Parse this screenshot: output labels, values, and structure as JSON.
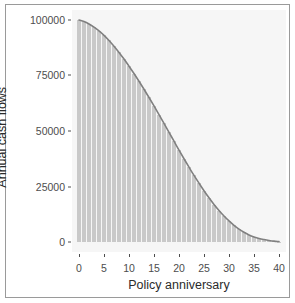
{
  "chart_data": {
    "type": "bar",
    "title": "",
    "subtitle": "",
    "xlabel": "Policy anniversary",
    "ylabel": "Annual cash flows",
    "xlim": [
      0,
      40
    ],
    "ylim": [
      0,
      100000
    ],
    "grid": false,
    "legend": null,
    "x_ticks": [
      0,
      5,
      10,
      15,
      20,
      25,
      30,
      35,
      40
    ],
    "x_tick_labels": [
      "0",
      "5",
      "10",
      "15",
      "20",
      "25",
      "30",
      "35",
      "40"
    ],
    "y_ticks": [
      0,
      25000,
      50000,
      75000,
      100000
    ],
    "y_tick_labels": [
      "0",
      "25000",
      "50000",
      "75000",
      "100000"
    ],
    "bar_color": "#c9c9c9",
    "line_color": "#808080",
    "panel_background": "#f6f6f6",
    "categories": [
      0,
      1,
      2,
      3,
      4,
      5,
      6,
      7,
      8,
      9,
      10,
      11,
      12,
      13,
      14,
      15,
      16,
      17,
      18,
      19,
      20,
      21,
      22,
      23,
      24,
      25,
      26,
      27,
      28,
      29,
      30,
      31,
      32,
      33,
      34,
      35,
      36,
      37,
      38,
      39,
      40
    ],
    "series": [
      {
        "name": "Annual cash flows (bars)",
        "type": "bar",
        "values": [
          100000,
          99300,
          98200,
          96800,
          95100,
          93100,
          90800,
          88200,
          85400,
          82400,
          79200,
          75900,
          72400,
          68800,
          65100,
          61300,
          57400,
          53400,
          49400,
          45400,
          41400,
          37500,
          33700,
          30000,
          26500,
          23100,
          19900,
          16900,
          14200,
          11700,
          9500,
          7500,
          5800,
          4400,
          3200,
          2300,
          1600,
          1100,
          700,
          400,
          200
        ]
      },
      {
        "name": "Annual cash flows (curve)",
        "type": "line",
        "values": [
          100000,
          99300,
          98200,
          96800,
          95100,
          93100,
          90800,
          88200,
          85400,
          82400,
          79200,
          75900,
          72400,
          68800,
          65100,
          61300,
          57400,
          53400,
          49400,
          45400,
          41400,
          37500,
          33700,
          30000,
          26500,
          23100,
          19900,
          16900,
          14200,
          11700,
          9500,
          7500,
          5800,
          4400,
          3200,
          2300,
          1600,
          1100,
          700,
          400,
          200
        ]
      }
    ]
  }
}
